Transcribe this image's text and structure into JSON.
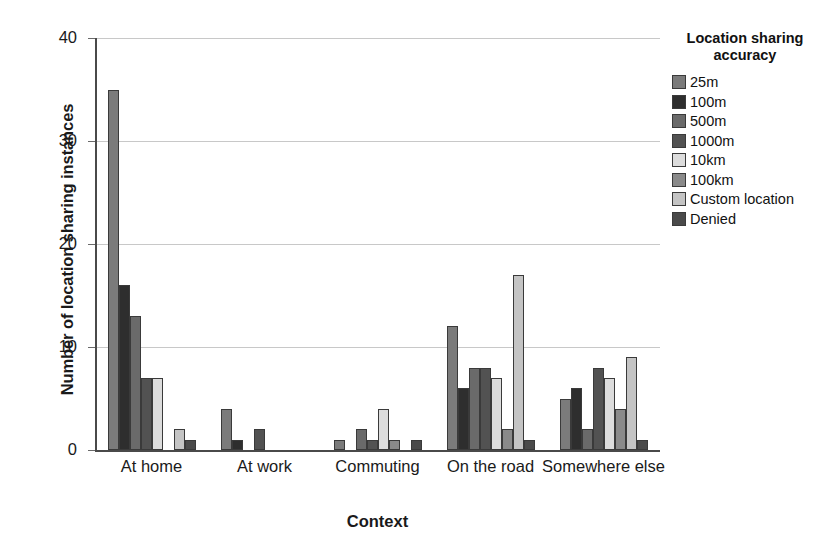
{
  "chart_data": {
    "type": "bar",
    "title": "",
    "xlabel": "Context",
    "ylabel": "Number of location sharing instances",
    "categories": [
      "At home",
      "At work",
      "Commuting",
      "On the road",
      "Somewhere else"
    ],
    "ylim": [
      0,
      40
    ],
    "yticks": [
      0,
      10,
      20,
      30,
      40
    ],
    "grid": true,
    "legend_position": "right",
    "legend_title": "Location sharing accuracy",
    "series": [
      {
        "name": "25m",
        "color": "#7b7b7b",
        "values": [
          35,
          4,
          1,
          12,
          5
        ]
      },
      {
        "name": "100m",
        "color": "#2e2e2e",
        "values": [
          16,
          1,
          0,
          6,
          6
        ]
      },
      {
        "name": "500m",
        "color": "#6a6a6a",
        "values": [
          13,
          0,
          2,
          8,
          2
        ]
      },
      {
        "name": "1000m",
        "color": "#525252",
        "values": [
          7,
          2,
          1,
          8,
          8
        ]
      },
      {
        "name": "10km",
        "color": "#dcdcdc",
        "values": [
          7,
          0,
          4,
          7,
          7
        ]
      },
      {
        "name": "100km",
        "color": "#8a8a8a",
        "values": [
          0,
          0,
          1,
          2,
          4
        ]
      },
      {
        "name": "Custom location",
        "color": "#c4c4c4",
        "values": [
          2,
          0,
          0,
          17,
          9
        ]
      },
      {
        "name": "Denied",
        "color": "#4a4a4a",
        "values": [
          1,
          0,
          1,
          1,
          1
        ]
      }
    ]
  }
}
